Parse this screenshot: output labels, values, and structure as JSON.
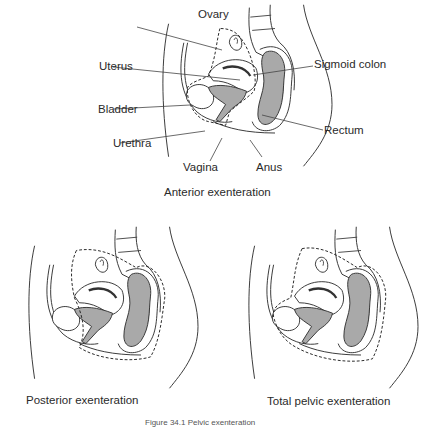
{
  "top_diagram": {
    "caption": "Anterior exenteration",
    "labels": {
      "ovary": "Ovary",
      "uterus": "Uterus",
      "bladder": "Bladder",
      "urethra": "Urethra",
      "vagina": "Vagina",
      "anus": "Anus",
      "sigmoid_colon": "Sigmoid colon",
      "rectum": "Rectum"
    }
  },
  "bottom_left_diagram": {
    "caption": "Posterior exenteration"
  },
  "bottom_right_diagram": {
    "caption": "Total pelvic exenteration"
  },
  "figure_caption": "Figure 34.1 Pelvic exenteration",
  "colors": {
    "line": "#333333",
    "organ_fill": "#a9a9a9",
    "background": "#ffffff"
  }
}
